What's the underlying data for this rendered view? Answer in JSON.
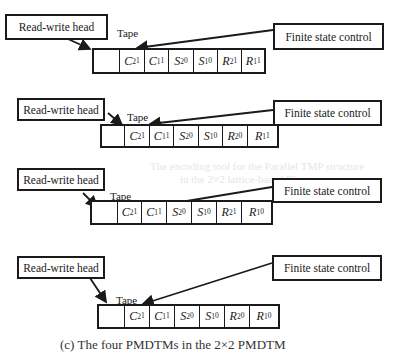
{
  "labels": {
    "read_write_head": "Read-write head",
    "finite_state_control": "Finite state control",
    "tape": "Tape"
  },
  "panels": [
    {
      "cells": [
        {
          "sym": "",
          "sub": "",
          "sup": ""
        },
        {
          "sym": "C",
          "sub": "2",
          "sup": "1"
        },
        {
          "sym": "C",
          "sub": "1",
          "sup": "1"
        },
        {
          "sym": "S",
          "sub": "2",
          "sup": "0"
        },
        {
          "sym": "S",
          "sub": "1",
          "sup": "0"
        },
        {
          "sym": "R",
          "sub": "2",
          "sup": "1"
        },
        {
          "sym": "R",
          "sub": "1",
          "sup": "1"
        }
      ]
    },
    {
      "cells": [
        {
          "sym": "",
          "sub": "",
          "sup": ""
        },
        {
          "sym": "C",
          "sub": "2",
          "sup": "1"
        },
        {
          "sym": "C",
          "sub": "1",
          "sup": "1"
        },
        {
          "sym": "S",
          "sub": "2",
          "sup": "0"
        },
        {
          "sym": "S",
          "sub": "1",
          "sup": "0"
        },
        {
          "sym": "R",
          "sub": "2",
          "sup": "0"
        },
        {
          "sym": "R",
          "sub": "1",
          "sup": "1"
        }
      ]
    },
    {
      "cells": [
        {
          "sym": "",
          "sub": "",
          "sup": ""
        },
        {
          "sym": "C",
          "sub": "2",
          "sup": "1"
        },
        {
          "sym": "C",
          "sub": "1",
          "sup": "1"
        },
        {
          "sym": "S",
          "sub": "2",
          "sup": "0"
        },
        {
          "sym": "S",
          "sub": "1",
          "sup": "0"
        },
        {
          "sym": "R",
          "sub": "2",
          "sup": "1"
        },
        {
          "sym": "R",
          "sub": "1",
          "sup": "0"
        }
      ]
    },
    {
      "cells": [
        {
          "sym": "",
          "sub": "",
          "sup": ""
        },
        {
          "sym": "C",
          "sub": "2",
          "sup": "1"
        },
        {
          "sym": "C",
          "sub": "1",
          "sup": "1"
        },
        {
          "sym": "S",
          "sub": "2",
          "sup": "0"
        },
        {
          "sym": "S",
          "sub": "1",
          "sup": "0"
        },
        {
          "sym": "R",
          "sub": "2",
          "sup": "0"
        },
        {
          "sym": "R",
          "sub": "1",
          "sup": "0"
        }
      ]
    }
  ],
  "caption": "(c) The four PMDTMs in the 2×2 PMDTM",
  "background_text": [
    "The encoding tool for the Parallel TMP structure",
    "in the 2×2 lattice-based Diagram"
  ]
}
